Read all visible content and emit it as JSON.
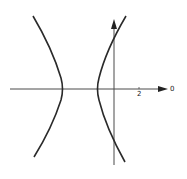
{
  "diagram": {
    "type": "hyperbola-polar-plot",
    "axis_labels": {
      "tick_label": "2",
      "polar_axis_label": "0"
    },
    "colors": {
      "curve": "#2a2a2a",
      "axis": "#4a4a4a",
      "background": "#ffffff"
    }
  }
}
